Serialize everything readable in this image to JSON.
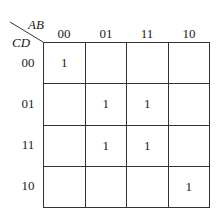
{
  "kmap": {
    "row_var": "CD",
    "col_var": "AB",
    "col_headers": [
      "00",
      "01",
      "11",
      "10"
    ],
    "row_headers": [
      "00",
      "01",
      "11",
      "10"
    ],
    "cells": [
      [
        "1",
        "",
        "",
        ""
      ],
      [
        "",
        "1",
        "1",
        ""
      ],
      [
        "",
        "1",
        "1",
        ""
      ],
      [
        "",
        "",
        "",
        "1"
      ]
    ]
  }
}
